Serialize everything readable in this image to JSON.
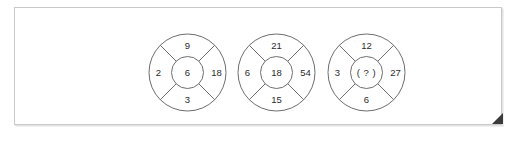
{
  "frame": {
    "background_color": "#ffffff",
    "border_color": "#c9c9c9",
    "fold_marker_color": "#3a3a3a"
  },
  "puzzle": {
    "type": "number-wheel-sequence",
    "stroke_color": "#6e6e6e",
    "text_color": "#2b2b2b",
    "unknown_marker": "( ? )",
    "wheels": [
      {
        "name": "wheel-1",
        "top": "9",
        "left": "2",
        "right": "18",
        "bottom": "3",
        "center": "6"
      },
      {
        "name": "wheel-2",
        "top": "21",
        "left": "6",
        "right": "54",
        "bottom": "15",
        "center": "18"
      },
      {
        "name": "wheel-3",
        "top": "12",
        "left": "3",
        "right": "27",
        "bottom": "6",
        "center": "( ? )"
      }
    ]
  }
}
